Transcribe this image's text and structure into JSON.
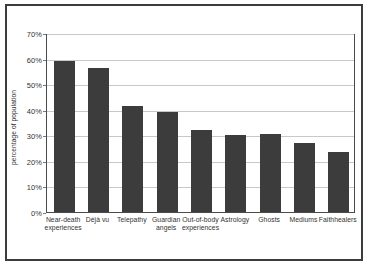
{
  "chart_data": {
    "type": "bar",
    "title": "",
    "xlabel": "",
    "ylabel": "percentage of population",
    "ylim": [
      0,
      70
    ],
    "grid": true,
    "legend": "none",
    "orientation": "vertical",
    "bar_color": "#3c3c3c",
    "background_color": "#ffffff",
    "gridline_color": "#c8c8c8",
    "axis_color": "#4a4a4a",
    "frame_color": "#3c3c3c",
    "categories": [
      "Near-death experiences",
      "Déjà vu",
      "Telepathy",
      "Guardian angels",
      "Out-of-body experiences",
      "Astrology",
      "Ghosts",
      "Mediums",
      "Faithhealers"
    ],
    "category_label_lines": [
      "Near-death\nexperiences",
      "Déjà vu",
      "Telepathy",
      "Guardian\nangels",
      "Out-of-body\nexperiences",
      "Astrology",
      "Ghosts",
      "Mediums",
      "Faithhealers"
    ],
    "values": [
      59,
      56.5,
      41.5,
      39,
      32,
      30,
      30.5,
      27,
      23.5
    ],
    "ytick_values": [
      0,
      10,
      20,
      30,
      40,
      50,
      60,
      70
    ],
    "ytick_labels": [
      "0%",
      "10%",
      "20%",
      "30%",
      "40%",
      "50%",
      "60%",
      "70%"
    ]
  }
}
